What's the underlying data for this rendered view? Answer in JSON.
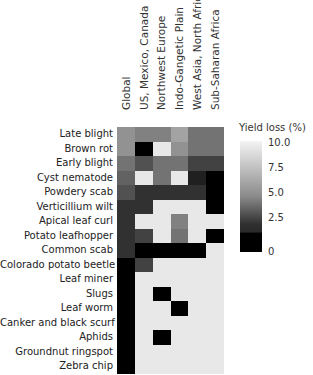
{
  "chart_data": {
    "type": "heatmap",
    "title": "",
    "xlabel": "",
    "ylabel": "",
    "columns": [
      "Global",
      "US, Mexico, Canada",
      "Northwest Europe",
      "Indo-Gangetic Plain",
      "West Asia, North Africa",
      "Sub-Saharan Africa"
    ],
    "rows": [
      "Late blight",
      "Brown rot",
      "Early blight",
      "Cyst nematode",
      "Powdery scab",
      "Verticillium wilt",
      "Apical leaf curl",
      "Potato leafhopper",
      "Common scab",
      "Colorado potato beetle",
      "Leaf miner",
      "Slugs",
      "Leaf worm",
      "Canker and black scurf",
      "Aphids",
      "Groundnut ringspot",
      "Zebra chip"
    ],
    "values": [
      [
        6.0,
        5.3,
        5.3,
        6.7,
        4.7,
        4.7
      ],
      [
        6.0,
        0.0,
        9.5,
        6.0,
        4.7,
        4.7
      ],
      [
        4.7,
        3.3,
        4.7,
        4.7,
        2.7,
        2.7
      ],
      [
        4.0,
        9.5,
        4.7,
        9.5,
        1.3,
        0.0
      ],
      [
        3.3,
        2.0,
        2.0,
        2.0,
        2.0,
        0.0
      ],
      [
        2.0,
        2.0,
        9.5,
        9.5,
        9.5,
        0.0
      ],
      [
        2.0,
        9.5,
        9.5,
        5.3,
        9.5,
        9.5
      ],
      [
        2.0,
        2.7,
        9.5,
        4.7,
        9.5,
        0.0
      ],
      [
        2.0,
        0.0,
        0.0,
        0.0,
        0.0,
        9.5
      ],
      [
        0.0,
        2.7,
        9.5,
        9.5,
        9.5,
        9.5
      ],
      [
        0.0,
        9.5,
        9.5,
        9.5,
        9.5,
        9.5
      ],
      [
        0.0,
        9.5,
        0.0,
        9.5,
        9.5,
        9.5
      ],
      [
        0.0,
        9.5,
        9.5,
        0.0,
        9.5,
        9.5
      ],
      [
        0.0,
        9.5,
        9.5,
        9.5,
        9.5,
        9.5
      ],
      [
        0.0,
        9.5,
        0.0,
        9.5,
        9.5,
        9.5
      ],
      [
        0.0,
        9.5,
        9.5,
        9.5,
        9.5,
        9.5
      ],
      [
        0.0,
        9.5,
        9.5,
        9.5,
        9.5,
        9.5
      ]
    ],
    "colorbar": {
      "title": "Yield loss (%)",
      "ticks": [
        "10.0",
        "7.5",
        "5.0",
        "2.5",
        "0"
      ],
      "range": [
        0,
        10
      ],
      "colormap": "black (0) to white (10)"
    },
    "legend_position": "right"
  }
}
